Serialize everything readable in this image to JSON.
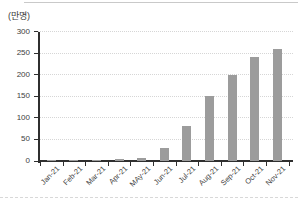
{
  "page": {
    "colors": {
      "bar": "#9c9c9c",
      "axis": "#2f2f2f",
      "gridline": "#d6d6d6",
      "tick_label": "#404040",
      "top_border": "#c9c9c9"
    }
  },
  "chart_data": {
    "type": "bar",
    "title": "",
    "unit_label": "(만명)",
    "categories": [
      "Jan-21",
      "Feb-21",
      "Mar-21",
      "Apr-21",
      "MAy-21",
      "Jun-21",
      "Jul-21",
      "Aug-21",
      "Sep-21",
      "Oct-21",
      "Nov-21"
    ],
    "values": [
      1,
      2,
      2,
      4,
      8,
      30,
      80,
      150,
      200,
      240,
      260
    ],
    "xlabel": "",
    "ylabel": "(만명)",
    "ylim": [
      0,
      300
    ],
    "ytick_interval": 50,
    "ytick_labels": [
      "0",
      "50",
      "100",
      "150",
      "200",
      "250",
      "300"
    ],
    "grid": true,
    "grid_style": "dotted-horizontal",
    "legend": "none",
    "bar_color": "#9c9c9c"
  }
}
